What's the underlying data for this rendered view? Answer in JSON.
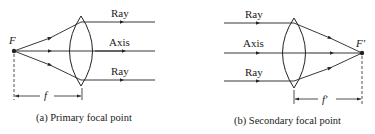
{
  "figure_a": {
    "focal_label": "F",
    "ray_top_label": "Ray",
    "axis_label": "Axis",
    "ray_bottom_label": "Ray",
    "distance_label": "f",
    "caption": "(a) Primary focal point"
  },
  "figure_b": {
    "focal_label": "F'",
    "ray_top_label": "Ray",
    "axis_label": "Axis",
    "ray_bottom_label": "Ray",
    "distance_label": "f'",
    "caption": "(b) Secondary focal point"
  },
  "colors": {
    "ink": "#222222",
    "background": "#ffffff"
  }
}
